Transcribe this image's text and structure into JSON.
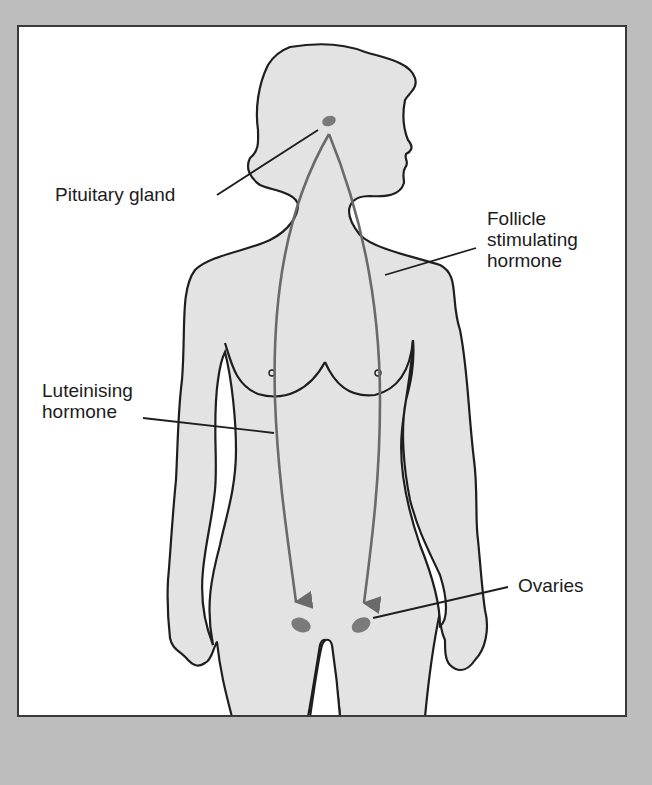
{
  "figure": {
    "colors": {
      "background": "#bdbdbd",
      "frame": "#ffffff",
      "body_fill": "#e3e3e3",
      "outline": "#1e1e1e",
      "arrow": "#6a6a6a",
      "gland": "#7a7a7a"
    }
  },
  "labels": {
    "pituitary": "Pituitary gland",
    "fsh": "Follicle\nstimulating\nhormone",
    "lh": "Luteinising\nhormone",
    "ovaries": "Ovaries"
  }
}
